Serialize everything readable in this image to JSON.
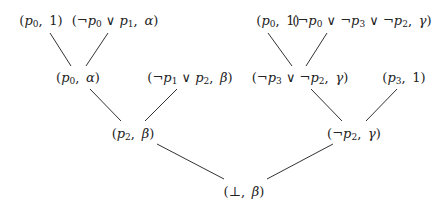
{
  "diagram": {
    "type": "resolution-tree",
    "nodes": [
      {
        "id": "n1",
        "label": "(p0, 1)",
        "x": 41,
        "y": 21
      },
      {
        "id": "n2",
        "label": "(¬p0 ∨ p1, α)",
        "x": 115,
        "y": 21
      },
      {
        "id": "n3",
        "label": "(p0, 1)",
        "x": 278,
        "y": 21
      },
      {
        "id": "n4",
        "label": "(¬p0 ∨ ¬p3 ∨ ¬p2, γ)",
        "x": 362,
        "y": 21
      },
      {
        "id": "n5",
        "label": "(p0, α)",
        "x": 78,
        "y": 78
      },
      {
        "id": "n6",
        "label": "(¬p1 ∨ p2, β)",
        "x": 190,
        "y": 78
      },
      {
        "id": "n7",
        "label": "(¬p3 ∨ ¬p2, γ)",
        "x": 300,
        "y": 78
      },
      {
        "id": "n8",
        "label": "(p3, 1)",
        "x": 404,
        "y": 78
      },
      {
        "id": "n9",
        "label": "(p2, β)",
        "x": 133,
        "y": 134
      },
      {
        "id": "n10",
        "label": "(¬p2, γ)",
        "x": 354,
        "y": 134
      },
      {
        "id": "n11",
        "label": "(⊥, β)",
        "x": 244,
        "y": 191
      }
    ],
    "edges": [
      {
        "from": "n1",
        "to": "n5",
        "x1": 50,
        "y1": 33,
        "x2": 71,
        "y2": 66
      },
      {
        "from": "n2",
        "to": "n5",
        "x1": 108,
        "y1": 33,
        "x2": 86,
        "y2": 66
      },
      {
        "from": "n3",
        "to": "n7",
        "x1": 268,
        "y1": 33,
        "x2": 292,
        "y2": 66
      },
      {
        "from": "n4",
        "to": "n7",
        "x1": 327,
        "y1": 33,
        "x2": 306,
        "y2": 66
      },
      {
        "from": "n5",
        "to": "n9",
        "x1": 90,
        "y1": 89,
        "x2": 121,
        "y2": 121
      },
      {
        "from": "n6",
        "to": "n9",
        "x1": 177,
        "y1": 89,
        "x2": 145,
        "y2": 121
      },
      {
        "from": "n7",
        "to": "n10",
        "x1": 311,
        "y1": 89,
        "x2": 342,
        "y2": 121
      },
      {
        "from": "n8",
        "to": "n10",
        "x1": 397,
        "y1": 89,
        "x2": 366,
        "y2": 121
      },
      {
        "from": "n9",
        "to": "n11",
        "x1": 157,
        "y1": 144,
        "x2": 224,
        "y2": 179
      },
      {
        "from": "n10",
        "to": "n11",
        "x1": 333,
        "y1": 144,
        "x2": 267,
        "y2": 179
      }
    ]
  }
}
